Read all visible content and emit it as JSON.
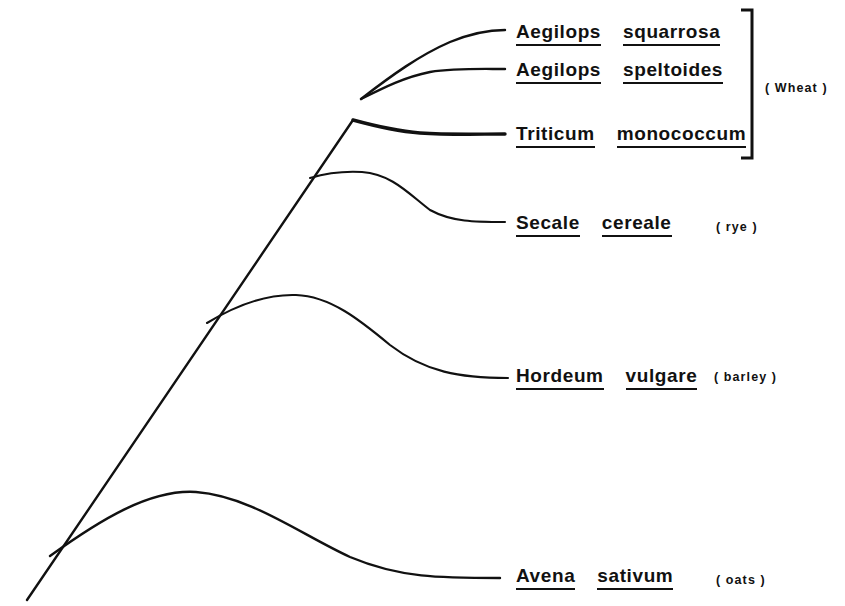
{
  "figure": {
    "type": "phylogenetic-tree",
    "background_color": "#ffffff",
    "line_color": "#111111"
  },
  "taxa": [
    {
      "id": "aegilops-squarrosa",
      "genus": "Aegilops",
      "species": "squarrosa",
      "common_name": "",
      "label_x": 516,
      "label_y": 22,
      "tip_x": 505,
      "tip_y": 30
    },
    {
      "id": "aegilops-speltoides",
      "genus": "Aegilops",
      "species": "speltoides",
      "common_name": "",
      "label_x": 516,
      "label_y": 60,
      "tip_x": 505,
      "tip_y": 69
    },
    {
      "id": "triticum-monococcum",
      "genus": "Triticum",
      "species": "monococcum",
      "common_name": "",
      "label_x": 516,
      "label_y": 124,
      "tip_x": 505,
      "tip_y": 134
    },
    {
      "id": "secale-cereale",
      "genus": "Secale",
      "species": "cereale",
      "common_name": "( rye )",
      "common_x": 716,
      "common_y": 221,
      "label_x": 516,
      "label_y": 213,
      "tip_x": 505,
      "tip_y": 222
    },
    {
      "id": "hordeum-vulgare",
      "genus": "Hordeum",
      "species": "vulgare",
      "common_name": "( barley )",
      "common_x": 714,
      "common_y": 371,
      "label_x": 516,
      "label_y": 366,
      "tip_x": 508,
      "tip_y": 378
    },
    {
      "id": "avena-sativum",
      "genus": "Avena",
      "species": "sativum",
      "common_name": "( oats )",
      "common_x": 716,
      "common_y": 574,
      "label_x": 516,
      "label_y": 566,
      "tip_x": 500,
      "tip_y": 578
    }
  ],
  "groups": [
    {
      "id": "wheat-group",
      "label": "( Wheat )",
      "label_x": 765,
      "label_y": 82,
      "bracket_top": 10,
      "bracket_bottom": 158,
      "bracket_x": 752,
      "bracket_tick": 11
    }
  ],
  "branches": [
    {
      "id": "trunk",
      "path": "M 27 600 L 353 120",
      "weight": "branch-med"
    },
    {
      "id": "branch-avena",
      "path": "M 50 556 C 100 520, 150 489, 196 492 C 250 496, 300 534, 350 557 C 400 578, 440 578, 500 578",
      "weight": "branch-med"
    },
    {
      "id": "branch-hordeum",
      "path": "M 207 323 C 240 303, 268 294, 296 295 C 330 296, 360 320, 390 345 C 425 372, 460 378, 508 378",
      "weight": "branch-thin"
    },
    {
      "id": "branch-secale",
      "path": "M 310 178 C 330 172, 345 171, 362 172 C 392 174, 410 195, 430 210 C 452 222, 475 222, 505 222",
      "weight": "branch-thin"
    },
    {
      "id": "branch-triticum",
      "path": "M 353 120 C 375 126, 395 131, 420 133 C 450 135, 478 134, 505 134",
      "weight": "branch-thick"
    },
    {
      "id": "branch-speltoides",
      "path": "M 361 99 C 385 87, 405 77, 430 72 C 455 68, 480 69, 505 69",
      "weight": "branch-med"
    },
    {
      "id": "branch-squarrosa",
      "path": "M 361 99 C 392 75, 420 55, 450 42 C 472 33, 488 30, 505 30",
      "weight": "branch-med"
    }
  ]
}
